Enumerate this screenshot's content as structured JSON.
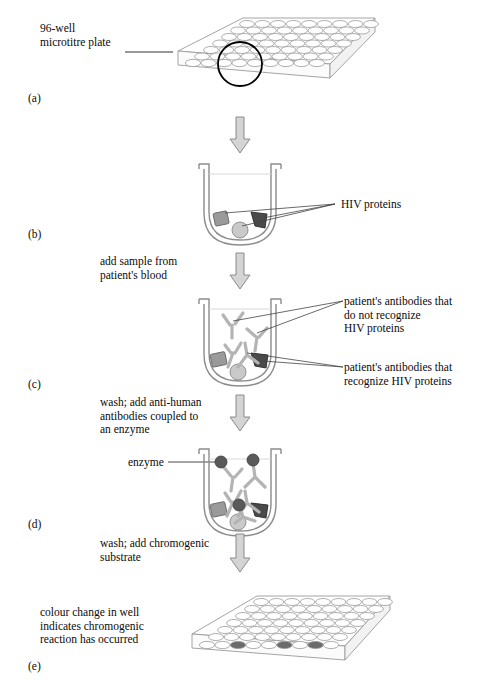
{
  "figure": {
    "title_alt": "ELISA test for HIV antibodies",
    "panels": [
      {
        "id": "a",
        "label": "(a)"
      },
      {
        "id": "b",
        "label": "(b)"
      },
      {
        "id": "c",
        "label": "(c)"
      },
      {
        "id": "d",
        "label": "(d)"
      },
      {
        "id": "e",
        "label": "(e)"
      }
    ],
    "callouts": {
      "plate": "96-well\nmicrotitre plate",
      "hiv_proteins": "HIV proteins",
      "antibodies_no_recognize": "patient's antibodies that\ndo not recognize\nHIV proteins",
      "antibodies_recognize": "patient's antibodies that\nrecognize HIV proteins",
      "enzyme": "enzyme",
      "colour_change": "colour change in well\nindicates chromogenic\nreaction has occurred"
    },
    "steps": [
      {
        "id": "step-1",
        "text": "add sample from\npatient's blood"
      },
      {
        "id": "step-2",
        "text": "wash; add anti-human\nantibodies coupled to\nan enzyme"
      },
      {
        "id": "step-3",
        "text": "wash; add chromogenic\nsubstrate"
      }
    ],
    "plate": {
      "rows": 8,
      "cols": 12,
      "positive_wells_front_row": [
        3,
        6,
        8
      ]
    },
    "colors": {
      "line": "#6e6e6e",
      "dark_line": "#000000",
      "protein_square": "#9a9a9a",
      "protein_circle": "#c9c9c9",
      "protein_triangle": "#4a4a4a",
      "enzyme_dot": "#5a5a5a",
      "arrow_fill": "#d4d4d4",
      "arrow_stroke": "#8a8a8a",
      "positive_well": "#6b6b6b",
      "well_outline": "#8c8c8c"
    }
  }
}
